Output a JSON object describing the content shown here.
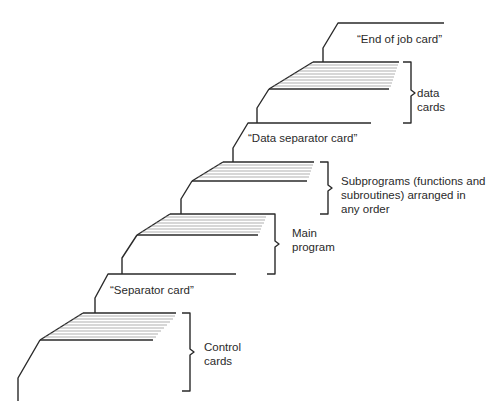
{
  "diagram": {
    "title": "",
    "stroke_color": "#2a2a2a",
    "card_line_color": "#9a9a9a",
    "labels": {
      "end_of_job": "“End of job card”",
      "data_cards_1": "data",
      "data_cards_2": "cards",
      "data_separator": "“Data separator card”",
      "subprograms_1": "Subprograms (functions and",
      "subprograms_2": "subroutines) arranged in",
      "subprograms_3": "any order",
      "main_program_1": "Main",
      "main_program_2": "program",
      "separator": "“Separator card”",
      "control_cards_1": "Control",
      "control_cards_2": "cards"
    },
    "groups": [
      {
        "name": "End of job card",
        "type": "single-card"
      },
      {
        "name": "data cards",
        "type": "deck"
      },
      {
        "name": "Data separator card",
        "type": "single-card"
      },
      {
        "name": "Subprograms (functions and subroutines) arranged in any order",
        "type": "deck"
      },
      {
        "name": "Main program",
        "type": "deck"
      },
      {
        "name": "Separator card",
        "type": "single-card"
      },
      {
        "name": "Control cards",
        "type": "deck"
      }
    ]
  }
}
